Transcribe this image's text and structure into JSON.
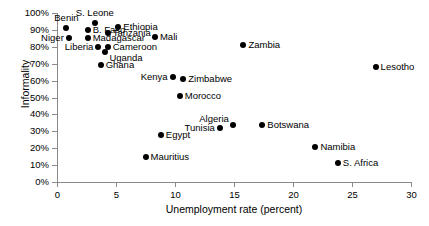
{
  "chart_data": {
    "type": "scatter",
    "title": "",
    "xlabel": "Unemployment rate (percent)",
    "ylabel": "Informality",
    "xlim": [
      0,
      30
    ],
    "ylim": [
      0,
      1
    ],
    "xticks": [
      "0",
      "5",
      "10",
      "15",
      "20",
      "25",
      "30"
    ],
    "xtick_values": [
      0,
      5,
      10,
      15,
      20,
      25,
      30
    ],
    "yticks": [
      "0%",
      "10%",
      "20%",
      "30%",
      "40%",
      "50%",
      "60%",
      "70%",
      "80%",
      "90%",
      "100%"
    ],
    "ytick_values": [
      0,
      10,
      20,
      30,
      40,
      50,
      60,
      70,
      80,
      90,
      100
    ],
    "grid": false,
    "legend": false,
    "marker_color": "#000000",
    "axis_color": "#8a8a8a",
    "points": [
      {
        "label": "Benin",
        "x": 0.8,
        "y": 91,
        "pos": "above"
      },
      {
        "label": "Niger",
        "x": 1.0,
        "y": 85,
        "pos": "left"
      },
      {
        "label": "S. Leone",
        "x": 3.2,
        "y": 94,
        "pos": "above"
      },
      {
        "label": "B. Faso",
        "x": 2.6,
        "y": 90,
        "pos": "right"
      },
      {
        "label": "Madagascar",
        "x": 2.6,
        "y": 85,
        "pos": "right"
      },
      {
        "label": "Liberia",
        "x": 3.5,
        "y": 80,
        "pos": "left"
      },
      {
        "label": "Ghana",
        "x": 3.7,
        "y": 69,
        "pos": "right"
      },
      {
        "label": "Tanzania",
        "x": 4.3,
        "y": 88,
        "pos": "right"
      },
      {
        "label": "Cameroon",
        "x": 4.3,
        "y": 80,
        "pos": "right"
      },
      {
        "label": "Uganda",
        "x": 4.1,
        "y": 77,
        "pos": "br"
      },
      {
        "label": "Ethiopia",
        "x": 5.2,
        "y": 92,
        "pos": "right"
      },
      {
        "label": "Mauritius",
        "x": 7.5,
        "y": 15,
        "pos": "right"
      },
      {
        "label": "Mali",
        "x": 8.3,
        "y": 86,
        "pos": "right"
      },
      {
        "label": "Egypt",
        "x": 8.8,
        "y": 28,
        "pos": "right"
      },
      {
        "label": "Kenya",
        "x": 9.8,
        "y": 62,
        "pos": "left"
      },
      {
        "label": "Zimbabwe",
        "x": 10.7,
        "y": 61,
        "pos": "right"
      },
      {
        "label": "Morocco",
        "x": 10.4,
        "y": 51,
        "pos": "right"
      },
      {
        "label": "Tunisia",
        "x": 13.8,
        "y": 32,
        "pos": "left"
      },
      {
        "label": "Algeria",
        "x": 14.9,
        "y": 34,
        "pos": "al"
      },
      {
        "label": "Zambia",
        "x": 15.8,
        "y": 81,
        "pos": "right"
      },
      {
        "label": "Botswana",
        "x": 17.4,
        "y": 34,
        "pos": "right"
      },
      {
        "label": "Namibia",
        "x": 21.9,
        "y": 21,
        "pos": "right"
      },
      {
        "label": "S. Africa",
        "x": 23.8,
        "y": 11,
        "pos": "right"
      },
      {
        "label": "Lesotho",
        "x": 27.0,
        "y": 68,
        "pos": "right"
      }
    ]
  }
}
